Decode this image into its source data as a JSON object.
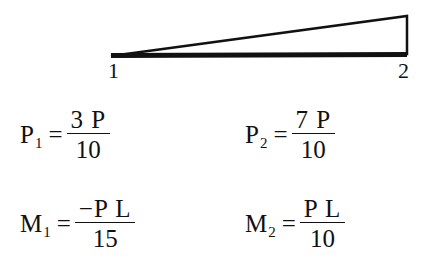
{
  "diagram": {
    "shape": "triangular distributed load",
    "line_color": "#111111",
    "nodes": [
      {
        "label": "1"
      },
      {
        "label": "2"
      }
    ]
  },
  "equations": [
    {
      "name": "P",
      "subscript": "1",
      "equals": "=",
      "numerator": "3 P",
      "denominator": "10"
    },
    {
      "name": "P",
      "subscript": "2",
      "equals": "=",
      "numerator": "7 P",
      "denominator": "10"
    },
    {
      "name": "M",
      "subscript": "1",
      "equals": "=",
      "numerator": "−P L",
      "denominator": "15"
    },
    {
      "name": "M",
      "subscript": "2",
      "equals": "=",
      "numerator": "P L",
      "denominator": "10"
    }
  ]
}
